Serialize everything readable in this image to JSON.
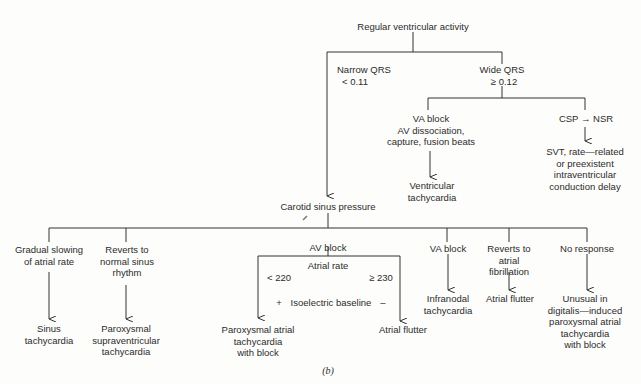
{
  "diagram": {
    "root": "Regular ventricular activity",
    "narrow": {
      "label": "Narrow QRS",
      "threshold": "< 0.11"
    },
    "wide": {
      "label": "Wide QRS",
      "threshold": "≥ 0.12"
    },
    "wide_branches": [
      {
        "condition": "VA block\nAV dissociation,\ncapture, fusion beats",
        "result": "Ventricular\ntachycardia"
      },
      {
        "condition": "CSP → NSR",
        "result": "SVT, rate—related\nor preexistent\nintraventricular\nconduction delay"
      }
    ],
    "csp": "Carotid sinus pressure",
    "csp_branches": [
      {
        "condition": "Gradual slowing\nof atrial rate",
        "result": "Sinus\ntachycardia"
      },
      {
        "condition": "Reverts to\nnormal sinus\nrhythm",
        "result": "Paroxysmal\nsupraventricular\ntachycardia"
      },
      {
        "condition": "AV block",
        "result": ""
      },
      {
        "condition": "VA block",
        "result": "Infranodal\ntachycardia"
      },
      {
        "condition": "Reverts to\natrial\nfibrillation",
        "result": "Atrial flutter"
      },
      {
        "condition": "No response",
        "result": "Unusual in\ndigitalis—induced\nparoxysmal atrial\ntachycardia\nwith block"
      }
    ],
    "av_block": {
      "criterion": "Atrial rate",
      "low": "< 220",
      "high": "≥ 230",
      "baseline_plus": "+",
      "baseline_label": "Isoelectric baseline",
      "baseline_minus": "–",
      "low_result": "Paroxysmal atrial\ntachycardia\nwith block",
      "high_result": "Atrial flutter"
    },
    "caption": "(b)"
  }
}
